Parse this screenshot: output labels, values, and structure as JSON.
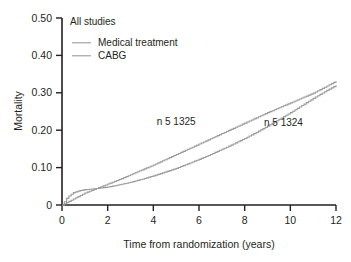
{
  "figure": {
    "panel_title": "All studies",
    "background_color": "#ffffff",
    "axis_color": "#231f20",
    "text_color": "#231f20"
  },
  "legend": {
    "position": "top-left-inside",
    "entries": [
      {
        "label": "Medical treatment",
        "color": "#9a9a9a",
        "swatch": "line-swatch"
      },
      {
        "label": "CABG",
        "color": "#9a9a9a",
        "swatch": "line-swatch"
      }
    ]
  },
  "annotations": [
    {
      "text": "n 5  1325",
      "series": "Medical treatment",
      "x": 5.0,
      "y": 0.215
    },
    {
      "text": "n 5  1324",
      "series": "CABG",
      "x": 9.7,
      "y": 0.212
    }
  ],
  "axes": {
    "x": {
      "title": "Time from randomization (years)",
      "ticks": [
        0,
        2,
        4,
        6,
        8,
        10,
        12
      ],
      "tick_labels": [
        "0",
        "2",
        "4",
        "6",
        "8",
        "10",
        "12"
      ],
      "range": [
        0,
        12
      ]
    },
    "y": {
      "title": "Mortality",
      "ticks": [
        0,
        0.1,
        0.2,
        0.3,
        0.4,
        0.5
      ],
      "tick_labels": [
        "0",
        "0.10",
        "0.20",
        "0.30",
        "0.40",
        "0.50"
      ],
      "range": [
        0,
        0.5
      ]
    }
  },
  "chart_data": {
    "type": "line",
    "title": "All studies",
    "subtitle": "",
    "xlabel": "Time from randomization (years)",
    "ylabel": "Mortality",
    "xlim": [
      0,
      12
    ],
    "ylim": [
      0,
      0.5
    ],
    "grid": false,
    "legend_position": "upper left (inside axes)",
    "x": [
      0,
      0.25,
      0.5,
      0.75,
      1,
      1.5,
      2,
      2.5,
      3,
      3.5,
      4,
      4.5,
      5,
      5.5,
      6,
      6.5,
      7,
      7.5,
      8,
      8.5,
      9,
      9.5,
      10,
      10.5,
      11,
      11.5,
      12
    ],
    "series": [
      {
        "name": "Medical treatment",
        "color": "#9a9a9a",
        "n": 1325,
        "annotation": "n 5  1325",
        "values": [
          0,
          0.008,
          0.016,
          0.024,
          0.032,
          0.044,
          0.056,
          0.068,
          0.081,
          0.094,
          0.107,
          0.121,
          0.135,
          0.149,
          0.163,
          0.177,
          0.191,
          0.205,
          0.219,
          0.233,
          0.247,
          0.26,
          0.273,
          0.286,
          0.299,
          0.315,
          0.331
        ]
      },
      {
        "name": "CABG",
        "color": "#9a9a9a",
        "n": 1324,
        "annotation": "n 5  1324",
        "values": [
          0,
          0.022,
          0.033,
          0.038,
          0.041,
          0.044,
          0.048,
          0.054,
          0.061,
          0.069,
          0.078,
          0.088,
          0.098,
          0.11,
          0.122,
          0.135,
          0.149,
          0.163,
          0.178,
          0.194,
          0.211,
          0.229,
          0.247,
          0.266,
          0.285,
          0.303,
          0.32
        ]
      }
    ]
  }
}
